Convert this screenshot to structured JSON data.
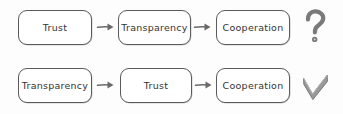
{
  "diagram": {
    "background_color": "#fdfdfd",
    "stroke_color": "#5b5b5b",
    "text_color": "#333333",
    "icon_color": "#7a7a7a",
    "rows": [
      {
        "id": "row-0",
        "nodes": [
          {
            "label": "Trust"
          },
          {
            "label": "Transparency"
          },
          {
            "label": "Cooperation"
          }
        ],
        "connector": "arrow-right",
        "verdict": "question-mark"
      },
      {
        "id": "row-1",
        "nodes": [
          {
            "label": "Transparency"
          },
          {
            "label": "Trust"
          },
          {
            "label": "Cooperation"
          }
        ],
        "connector": "arrow-right",
        "verdict": "check-mark"
      }
    ]
  }
}
